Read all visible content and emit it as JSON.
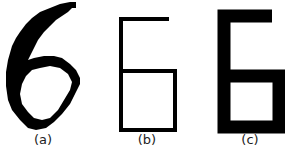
{
  "figure": {
    "panels": [
      {
        "id": "a",
        "label": "(a)",
        "description": "pixelated handwritten digit 6"
      },
      {
        "id": "b",
        "label": "(b)",
        "description": "thin-stroke skeleton digit 6"
      },
      {
        "id": "c",
        "label": "(c)",
        "description": "thick-stroke digit 6"
      }
    ],
    "colors": {
      "stroke": "#000000",
      "background": "#ffffff"
    }
  }
}
